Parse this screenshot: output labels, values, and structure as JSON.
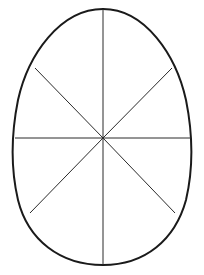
{
  "diagram": {
    "type": "egg-segmented-outline",
    "shape": "egg",
    "segments": 8,
    "colors": {
      "background": "#ffffff",
      "outline": "#1a1a1a",
      "dividers": "#2a2a2a"
    },
    "center": [
      103,
      138
    ],
    "bounds": {
      "top": 9,
      "bottom": 265,
      "left": 15,
      "right": 191
    },
    "dividers": [
      {
        "name": "vertical",
        "from": [
          103,
          9
        ],
        "to": [
          103,
          265
        ]
      },
      {
        "name": "horizontal",
        "from": [
          15,
          138
        ],
        "to": [
          191,
          138
        ]
      },
      {
        "name": "diagonal-upper-left",
        "from": [
          103,
          138
        ],
        "to": [
          35,
          68
        ]
      },
      {
        "name": "diagonal-upper-right",
        "from": [
          103,
          138
        ],
        "to": [
          172,
          68
        ]
      },
      {
        "name": "diagonal-lower-left",
        "from": [
          103,
          138
        ],
        "to": [
          30,
          213
        ]
      },
      {
        "name": "diagonal-lower-right",
        "from": [
          103,
          138
        ],
        "to": [
          175,
          213
        ]
      }
    ]
  }
}
